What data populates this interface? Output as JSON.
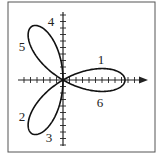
{
  "figure": {
    "type": "polar-rose",
    "equation_shape": "three-petal rose r = a·cos(3θ)",
    "frame": {
      "x": 8,
      "y": 2,
      "width": 147,
      "height": 150,
      "stroke": "#555555"
    },
    "origin": {
      "x": 63,
      "y": 80
    },
    "petal_radius_px": 62,
    "petals": 3,
    "curve_color": "#111111",
    "axis_color": "#222222",
    "x_axis": {
      "from": 18,
      "to": 148,
      "arrow": true,
      "tick_spacing": 6.5
    },
    "y_axis": {
      "from": 12,
      "to": 146,
      "arrow": false,
      "tick_spacing": 6.5
    },
    "labels": [
      {
        "text": "1",
        "x": 101,
        "y": 64
      },
      {
        "text": "6",
        "x": 100,
        "y": 107
      },
      {
        "text": "4",
        "x": 51,
        "y": 26
      },
      {
        "text": "5",
        "x": 22,
        "y": 51
      },
      {
        "text": "2",
        "x": 22,
        "y": 121
      },
      {
        "text": "3",
        "x": 49,
        "y": 142
      }
    ]
  }
}
